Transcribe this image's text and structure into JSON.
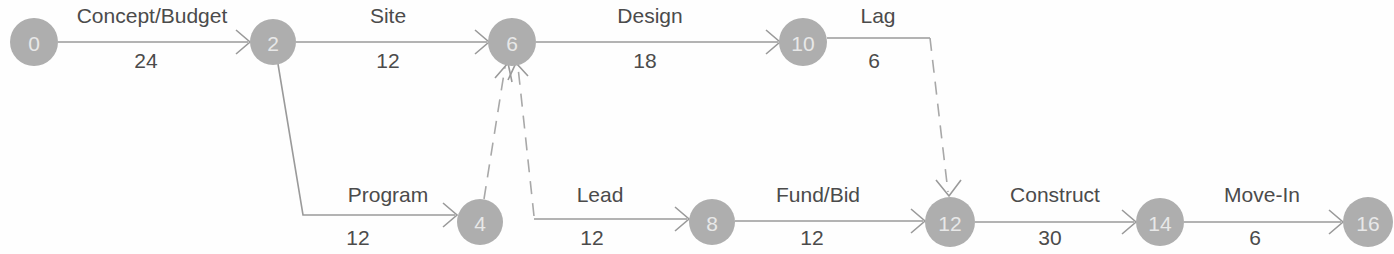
{
  "diagram": {
    "type": "activity-on-arrow-network",
    "colors": {
      "node_fill": "#aeaeae",
      "node_text": "#e8e8e8",
      "edge": "#9a9a9a",
      "label_text": "#4b4b4b",
      "background": "#fefefe"
    },
    "nodes": [
      {
        "id": "n0",
        "label": "0",
        "cx": 34,
        "cy": 42,
        "r": 24
      },
      {
        "id": "n2",
        "label": "2",
        "cx": 273,
        "cy": 42,
        "r": 23
      },
      {
        "id": "n6",
        "label": "6",
        "cx": 512,
        "cy": 42,
        "r": 24
      },
      {
        "id": "n10",
        "label": "10",
        "cx": 803,
        "cy": 42,
        "r": 24
      },
      {
        "id": "n4",
        "label": "4",
        "cx": 480,
        "cy": 222,
        "r": 23
      },
      {
        "id": "n8",
        "label": "8",
        "cx": 712,
        "cy": 222,
        "r": 23
      },
      {
        "id": "n12",
        "label": "12",
        "cx": 950,
        "cy": 222,
        "r": 25
      },
      {
        "id": "n14",
        "label": "14",
        "cx": 1160,
        "cy": 222,
        "r": 24
      },
      {
        "id": "n16",
        "label": "16",
        "cx": 1368,
        "cy": 222,
        "r": 25
      }
    ],
    "edges": [
      {
        "id": "e-concept-budget",
        "name": "Concept/Budget",
        "duration": "24",
        "from": "0",
        "to": "2",
        "style": "solid",
        "path": "M 58,42 L 248,42",
        "arrow": "M 236,30 L 250,42 L 236,54",
        "name_x": 152,
        "name_y": 23,
        "duration_x": 146,
        "duration_y": 68
      },
      {
        "id": "e-site",
        "name": "Site",
        "duration": "12",
        "from": "2",
        "to": "6",
        "style": "solid",
        "path": "M 296,42 L 487,42",
        "arrow": "M 475,30 L 489,42 L 475,54",
        "name_x": 388,
        "name_y": 23,
        "duration_x": 388,
        "duration_y": 68
      },
      {
        "id": "e-design",
        "name": "Design",
        "duration": "18",
        "from": "6",
        "to": "10",
        "style": "solid",
        "path": "M 536,42 L 778,42",
        "arrow": "M 766,30 L 780,42 L 766,54",
        "name_x": 650,
        "name_y": 23,
        "duration_x": 645,
        "duration_y": 68
      },
      {
        "id": "e-lag",
        "name": "Lag",
        "duration": "6",
        "from": "10",
        "to": "12",
        "style": "dashed-lag",
        "path": "M 827,38 L 930,38",
        "dashed_path": "M 930,38 L 948,192",
        "arrow": "M 936,180 L 949,196 L 961,180",
        "name_x": 878,
        "name_y": 23,
        "duration_x": 874,
        "duration_y": 68
      },
      {
        "id": "e-program",
        "name": "Program",
        "duration": "12",
        "from": "2",
        "to": "4",
        "style": "solid-elbow",
        "path": "M 278,64 L 303,215 L 455,215",
        "arrow": "M 443,203 L 457,215 L 443,227",
        "name_x": 388,
        "name_y": 202,
        "duration_x": 358,
        "duration_y": 245
      },
      {
        "id": "e-dummy-4-6",
        "name": "",
        "duration": "",
        "from": "4",
        "to": "6",
        "style": "dashed",
        "path": "M 484,199 L 505,67",
        "arrow": "M 495,78 L 508,63 L 512,82"
      },
      {
        "id": "e-dummy-lead-6",
        "name": "",
        "duration": "",
        "from": "lead-origin",
        "to": "6",
        "style": "dashed",
        "path": "M 534,216 L 518,67",
        "arrow": "M 508,80 L 516,63 L 528,76"
      },
      {
        "id": "e-lead",
        "name": "Lead",
        "duration": "12",
        "from": "4",
        "to": "8",
        "style": "solid",
        "path": "M 534,219 L 687,219",
        "arrow": "M 675,207 L 689,219 L 675,231",
        "name_x": 600,
        "name_y": 202,
        "duration_x": 592,
        "duration_y": 245
      },
      {
        "id": "e-fund-bid",
        "name": "Fund/Bid",
        "duration": "12",
        "from": "8",
        "to": "12",
        "style": "solid",
        "path": "M 735,221 L 923,221",
        "arrow": "M 911,209 L 925,221 L 911,233",
        "name_x": 818,
        "name_y": 202,
        "duration_x": 812,
        "duration_y": 245
      },
      {
        "id": "e-construct",
        "name": "Construct",
        "duration": "30",
        "from": "12",
        "to": "14",
        "style": "solid",
        "path": "M 975,222 L 1134,222",
        "arrow": "M 1122,210 L 1136,222 L 1122,234",
        "name_x": 1055,
        "name_y": 202,
        "duration_x": 1050,
        "duration_y": 245
      },
      {
        "id": "e-move-in",
        "name": "Move-In",
        "duration": "6",
        "from": "14",
        "to": "16",
        "style": "solid",
        "path": "M 1184,222 L 1341,222",
        "arrow": "M 1329,210 L 1343,222 L 1329,234",
        "name_x": 1262,
        "name_y": 202,
        "duration_x": 1255,
        "duration_y": 245
      }
    ]
  }
}
